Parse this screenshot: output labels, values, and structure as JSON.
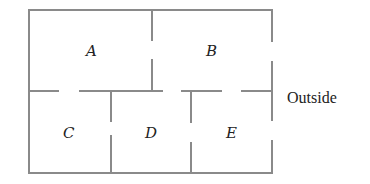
{
  "diagram": {
    "type": "floor-plan",
    "colors": {
      "wall": "#8a8a8a",
      "text": "#222222",
      "background": "#ffffff"
    },
    "rooms": [
      {
        "id": "A",
        "label": "A"
      },
      {
        "id": "B",
        "label": "B"
      },
      {
        "id": "C",
        "label": "C"
      },
      {
        "id": "D",
        "label": "D"
      },
      {
        "id": "E",
        "label": "E"
      }
    ],
    "outside_label": "Outside",
    "doors": [
      {
        "between": [
          "A",
          "B"
        ]
      },
      {
        "between": [
          "A",
          "C"
        ]
      },
      {
        "between": [
          "B",
          "D"
        ]
      },
      {
        "between": [
          "B",
          "E"
        ]
      },
      {
        "between": [
          "B",
          "Outside"
        ]
      },
      {
        "between": [
          "C",
          "D"
        ]
      },
      {
        "between": [
          "D",
          "E"
        ]
      },
      {
        "between": [
          "E",
          "Outside"
        ]
      }
    ]
  }
}
